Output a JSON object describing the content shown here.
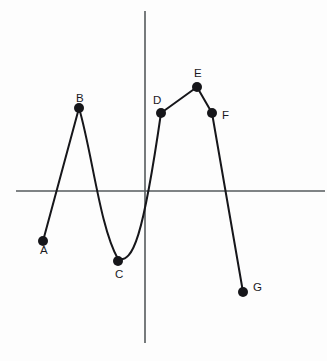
{
  "figure": {
    "title": "",
    "background_color": "#fdfdfd",
    "width": 327,
    "height": 361
  },
  "axes": {
    "x_axis": {
      "name": "horizontal-axis",
      "color": "#555a5c",
      "x_start": 16,
      "x_end": 325,
      "y": 191
    },
    "y_axis": {
      "name": "vertical-axis",
      "color": "#555a5c",
      "x": 145,
      "y_start": 11,
      "y_end": 343
    },
    "origin": {
      "x": 145,
      "y": 191
    }
  },
  "chart_data": {
    "type": "line",
    "title": "",
    "xlabel": "",
    "ylabel": "",
    "grid": false,
    "legend": null,
    "labels": [
      "A",
      "B",
      "C",
      "D",
      "E",
      "F",
      "G"
    ],
    "points": [
      {
        "label": "A",
        "px": 43,
        "py": 241,
        "label_px": 40,
        "label_py": 251,
        "x": -6.8,
        "y": -2.5
      },
      {
        "label": "B",
        "px": 79,
        "py": 108,
        "label_px": 76,
        "label_py": 99,
        "x": -4.4,
        "y": 2.1
      },
      {
        "label": "C",
        "px": 118,
        "py": 261,
        "label_px": 115,
        "label_py": 275,
        "x": -1.8,
        "y": -2.4
      },
      {
        "label": "D",
        "px": 161,
        "py": 113,
        "label_px": 153,
        "label_py": 101,
        "x": 1.1,
        "y": 1.9
      },
      {
        "label": "E",
        "px": 197,
        "py": 87,
        "label_px": 194,
        "label_py": 74,
        "x": 3.5,
        "y": 2.8
      },
      {
        "label": "F",
        "px": 212,
        "py": 113,
        "label_px": 222,
        "label_py": 116,
        "x": 4.5,
        "y": 1.9
      },
      {
        "label": "G",
        "px": 243,
        "py": 292,
        "label_px": 253,
        "label_py": 288,
        "x": 6.5,
        "y": -3.4
      }
    ],
    "segments": [
      {
        "from": "A",
        "to": "B",
        "shape": "straight"
      },
      {
        "from": "B",
        "to": "C",
        "shape": "curve"
      },
      {
        "from": "C",
        "to": "D",
        "shape": "curve"
      },
      {
        "from": "D",
        "to": "E",
        "shape": "straight"
      },
      {
        "from": "E",
        "to": "F",
        "shape": "straight"
      },
      {
        "from": "F",
        "to": "G",
        "shape": "straight"
      }
    ],
    "path_d": "M 43 241 L 79 108 C 92 152 100 228 118 259 C 133 263 143 238 161 113 L 197 87 L 212 113 L 243 292",
    "point_radius": 5.0,
    "curve_color": "#16161a",
    "point_color": "#16161a"
  }
}
